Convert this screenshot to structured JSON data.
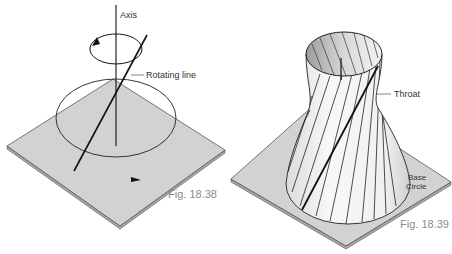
{
  "figures": [
    {
      "id": "fig-18-38",
      "caption": "Fig. 18.38",
      "labels": {
        "axis": "Axis",
        "rotating_line": "Rotating line"
      }
    },
    {
      "id": "fig-18-39",
      "caption": "Fig. 18.39",
      "labels": {
        "throat": "Throat",
        "base_line1": "Base",
        "base_line2": "Circle"
      }
    }
  ],
  "colors": {
    "plate": "#cfcfcf",
    "plate_edge": "#9a9a9a",
    "line": "#111111",
    "surface": "#f2f2f2",
    "caption": "#8a8a8a"
  }
}
